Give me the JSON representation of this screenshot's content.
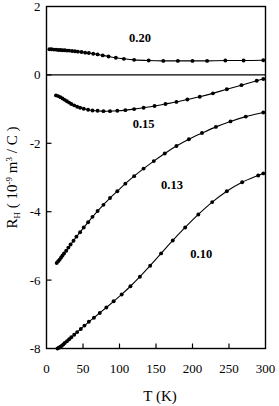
{
  "chart_data": {
    "type": "line",
    "title": "",
    "xlabel": "T (K)",
    "ylabel": "R_H ( 10^-9 m^3 / C )",
    "ylabel_parts": {
      "main1": "R",
      "sub1": "H",
      "main2": " ( 10",
      "sup1": "-9",
      "main3": " m",
      "sup2": "3",
      "main4": " / C )"
    },
    "xlim": [
      0,
      300
    ],
    "ylim": [
      -8,
      2
    ],
    "xticks": [
      0,
      50,
      100,
      150,
      200,
      250,
      300
    ],
    "xtick_labels": [
      "0",
      "50",
      "100",
      "150",
      "200",
      "250",
      "300"
    ],
    "yticks": [
      2,
      0,
      -2,
      -4,
      -6,
      -8
    ],
    "ytick_labels": [
      "2",
      "0",
      "-2",
      "-4",
      "-6",
      "-8"
    ],
    "grid": false,
    "legend_position": "inline-annotations",
    "marker_color": "#000000",
    "line_color": "#000000",
    "zero_reference_line": 0,
    "series": [
      {
        "name": "0.20",
        "label": "0.20",
        "label_x": 128,
        "label_y": 0.95,
        "x": [
          4,
          7,
          10,
          13,
          16,
          19,
          22,
          25,
          28,
          31,
          35,
          39,
          43,
          48,
          53,
          58,
          64,
          70,
          77,
          85,
          95,
          106,
          120,
          140,
          160,
          180,
          200,
          220,
          245,
          270,
          297
        ],
        "y": [
          0.75,
          0.75,
          0.74,
          0.74,
          0.73,
          0.73,
          0.72,
          0.72,
          0.71,
          0.71,
          0.7,
          0.69,
          0.68,
          0.67,
          0.65,
          0.64,
          0.62,
          0.6,
          0.57,
          0.54,
          0.5,
          0.47,
          0.44,
          0.42,
          0.41,
          0.41,
          0.41,
          0.41,
          0.42,
          0.42,
          0.43
        ]
      },
      {
        "name": "0.15",
        "label": "0.15",
        "label_x": 133,
        "label_y": -1.55,
        "x": [
          13,
          16,
          19,
          22,
          25,
          28,
          31,
          34,
          38,
          42,
          46,
          51,
          57,
          63,
          70,
          78,
          87,
          97,
          108,
          120,
          133,
          148,
          163,
          178,
          193,
          210,
          228,
          247,
          267,
          288,
          297
        ],
        "y": [
          -0.6,
          -0.62,
          -0.65,
          -0.69,
          -0.73,
          -0.77,
          -0.81,
          -0.85,
          -0.89,
          -0.93,
          -0.96,
          -0.99,
          -1.02,
          -1.04,
          -1.05,
          -1.06,
          -1.06,
          -1.05,
          -1.03,
          -1.0,
          -0.96,
          -0.91,
          -0.85,
          -0.79,
          -0.72,
          -0.64,
          -0.54,
          -0.42,
          -0.3,
          -0.17,
          -0.12
        ]
      },
      {
        "name": "0.13",
        "label": "0.13",
        "label_x": 172,
        "label_y": -3.35,
        "x": [
          14,
          16,
          18,
          20,
          22,
          24,
          27,
          30,
          33,
          37,
          41,
          46,
          51,
          57,
          63,
          70,
          78,
          87,
          97,
          108,
          120,
          133,
          147,
          162,
          178,
          195,
          213,
          232,
          252,
          273,
          297
        ],
        "y": [
          -5.5,
          -5.45,
          -5.4,
          -5.34,
          -5.28,
          -5.22,
          -5.14,
          -5.05,
          -4.96,
          -4.85,
          -4.73,
          -4.6,
          -4.46,
          -4.31,
          -4.15,
          -3.98,
          -3.8,
          -3.6,
          -3.4,
          -3.18,
          -2.96,
          -2.74,
          -2.52,
          -2.3,
          -2.08,
          -1.88,
          -1.7,
          -1.52,
          -1.36,
          -1.22,
          -1.1
        ]
      },
      {
        "name": "0.10",
        "label": "0.10",
        "label_x": 212,
        "label_y": -5.35,
        "x": [
          15,
          17,
          19,
          21,
          23,
          25,
          28,
          31,
          34,
          38,
          42,
          47,
          52,
          58,
          65,
          73,
          82,
          92,
          103,
          115,
          128,
          142,
          157,
          173,
          190,
          208,
          227,
          247,
          268,
          290,
          297
        ],
        "y": [
          -8.0,
          -7.98,
          -7.95,
          -7.92,
          -7.88,
          -7.84,
          -7.79,
          -7.73,
          -7.67,
          -7.6,
          -7.52,
          -7.43,
          -7.33,
          -7.22,
          -7.1,
          -6.96,
          -6.8,
          -6.62,
          -6.42,
          -6.18,
          -5.9,
          -5.58,
          -5.22,
          -4.84,
          -4.46,
          -4.08,
          -3.72,
          -3.4,
          -3.14,
          -2.94,
          -2.88
        ]
      }
    ]
  },
  "figure": {
    "name": "hall-coefficient-vs-temperature-plot"
  }
}
